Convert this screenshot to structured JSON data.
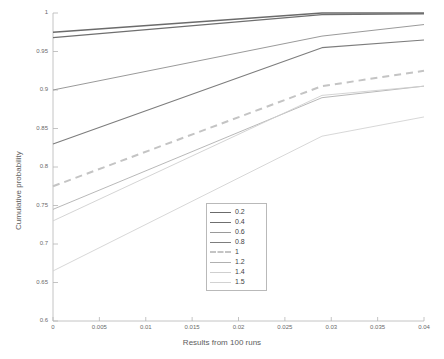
{
  "chart_data": {
    "type": "line",
    "title": "",
    "xlabel": "Results from 100 runs",
    "ylabel": "Cumulative probability",
    "xlim": [
      0,
      0.04
    ],
    "ylim": [
      0.6,
      1.0
    ],
    "grid": false,
    "legend_position": "center",
    "xticks": [
      "0",
      "0.005",
      "0.01",
      "0.015",
      "0.02",
      "0.025",
      "0.03",
      "0.035",
      "0.04"
    ],
    "xtick_values": [
      0,
      0.005,
      0.01,
      0.015,
      0.02,
      0.025,
      0.03,
      0.035,
      0.04
    ],
    "yticks": [
      "0.6",
      "0.65",
      "0.7",
      "0.75",
      "0.8",
      "0.85",
      "0.9",
      "0.95",
      "1"
    ],
    "ytick_values": [
      0.6,
      0.65,
      0.7,
      0.75,
      0.8,
      0.85,
      0.9,
      0.95,
      1.0
    ],
    "x": [
      0,
      0.029,
      0.04
    ],
    "series": [
      {
        "name": "0.2",
        "values": [
          0.975,
          1.0,
          1.0
        ],
        "color": "#6b6b6b",
        "style": "solid",
        "width": 1.3
      },
      {
        "name": "0.4",
        "values": [
          0.968,
          0.998,
          0.999
        ],
        "color": "#6f6f6f",
        "style": "solid",
        "width": 1.3
      },
      {
        "name": "0.6",
        "values": [
          0.9,
          0.97,
          0.985
        ],
        "color": "#9a9a9a",
        "style": "solid",
        "width": 1.0
      },
      {
        "name": "0.8",
        "values": [
          0.83,
          0.955,
          0.965
        ],
        "color": "#7d7d7d",
        "style": "solid",
        "width": 1.1
      },
      {
        "name": "1",
        "values": [
          0.775,
          0.905,
          0.925
        ],
        "color": "#c4c4c4",
        "style": "dashed",
        "width": 2.0
      },
      {
        "name": "1.2",
        "values": [
          0.745,
          0.89,
          0.905
        ],
        "color": "#b0b0b0",
        "style": "solid",
        "width": 0.9
      },
      {
        "name": "1.4",
        "values": [
          0.73,
          0.893,
          0.905
        ],
        "color": "#cfcfcf",
        "style": "solid",
        "width": 0.9
      },
      {
        "name": "1.5",
        "values": [
          0.665,
          0.84,
          0.865
        ],
        "color": "#d2d2d2",
        "style": "solid",
        "width": 0.9
      }
    ],
    "legend_entries": [
      "0.2",
      "0.4",
      "0.6",
      "0.8",
      "1",
      "1.2",
      "1.4",
      "1.5"
    ],
    "axis_color": "#b5b5b5"
  }
}
